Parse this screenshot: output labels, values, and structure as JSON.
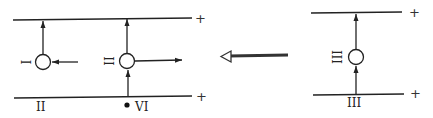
{
  "diagram": {
    "left_panel": {
      "top_line": {
        "terminal_sign": "+"
      },
      "bottom_line": {
        "terminal_sign": "+"
      },
      "nodes": [
        {
          "id": "node-1",
          "side_label": "I",
          "side_label_rotated": true
        },
        {
          "id": "node-2",
          "side_label": "II",
          "side_label_rotated": true
        }
      ],
      "bottom_labels": [
        {
          "text": "II"
        },
        {
          "text": "VI"
        }
      ],
      "marker": "●"
    },
    "transition_arrow": {
      "direction": "left",
      "style": "hollow"
    },
    "right_panel": {
      "top_line": {
        "terminal_sign": "+"
      },
      "bottom_line": {
        "terminal_sign": "+"
      },
      "nodes": [
        {
          "id": "node-3",
          "side_label": "III",
          "side_label_rotated": true
        }
      ],
      "bottom_labels": [
        {
          "text": "III"
        }
      ]
    },
    "colors": {
      "stroke": "#222222",
      "background": "#ffffff"
    }
  }
}
